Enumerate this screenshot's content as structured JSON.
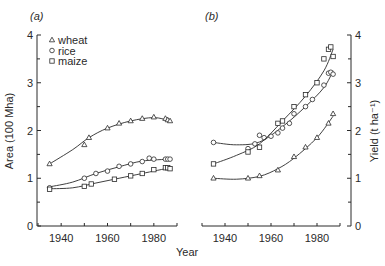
{
  "figure": {
    "panel_a_label": "(a)",
    "panel_b_label": "(b)",
    "shared_xlabel": "Year",
    "colors": {
      "ink": "#2a2a2a",
      "background": "#ffffff"
    }
  },
  "legend": {
    "position": "top-left of panel (a)",
    "entries": [
      {
        "name": "wheat",
        "marker": "triangle"
      },
      {
        "name": "rice",
        "marker": "circle"
      },
      {
        "name": "maize",
        "marker": "square"
      }
    ]
  },
  "chart_data": [
    {
      "type": "scatter",
      "title": "(a)",
      "xlabel": "Year",
      "ylabel": "Area (100 Mha)",
      "xlim": [
        1930,
        1990
      ],
      "ylim": [
        0,
        4
      ],
      "xticks": [
        1940,
        1960,
        1980
      ],
      "xminor": [
        1930,
        1950,
        1970,
        1990
      ],
      "yticks": [
        0,
        1,
        2,
        3,
        4
      ],
      "ytick_labels": [
        "0",
        "1",
        "2",
        "3",
        "4"
      ],
      "xtick_labels": [
        "1940",
        "1960",
        "1980"
      ],
      "grid": false,
      "yaxis_side": "left",
      "legend": [
        "wheat",
        "rice",
        "maize"
      ],
      "series": [
        {
          "name": "wheat",
          "marker": "triangle",
          "x": [
            1935,
            1950,
            1952,
            1960,
            1965,
            1970,
            1975,
            1980,
            1985,
            1986,
            1987
          ],
          "y": [
            1.3,
            1.7,
            1.85,
            2.05,
            2.15,
            2.2,
            2.25,
            2.28,
            2.25,
            2.22,
            2.2
          ],
          "fit": [
            [
              1935,
              1.3
            ],
            [
              1945,
              1.6
            ],
            [
              1952,
              1.85
            ],
            [
              1960,
              2.05
            ],
            [
              1970,
              2.2
            ],
            [
              1980,
              2.27
            ],
            [
              1987,
              2.2
            ]
          ]
        },
        {
          "name": "rice",
          "marker": "circle",
          "x": [
            1935,
            1950,
            1955,
            1960,
            1965,
            1970,
            1975,
            1978,
            1980,
            1985,
            1986,
            1987
          ],
          "y": [
            0.8,
            1.0,
            1.1,
            1.15,
            1.25,
            1.3,
            1.35,
            1.42,
            1.4,
            1.4,
            1.4,
            1.4
          ],
          "fit": [
            [
              1935,
              0.82
            ],
            [
              1945,
              0.92
            ],
            [
              1955,
              1.1
            ],
            [
              1965,
              1.24
            ],
            [
              1975,
              1.36
            ],
            [
              1987,
              1.4
            ]
          ]
        },
        {
          "name": "maize",
          "marker": "square",
          "x": [
            1935,
            1950,
            1953,
            1963,
            1970,
            1975,
            1980,
            1985,
            1986,
            1987
          ],
          "y": [
            0.77,
            0.83,
            0.88,
            0.98,
            1.05,
            1.1,
            1.18,
            1.22,
            1.22,
            1.2
          ],
          "fit": [
            [
              1935,
              0.78
            ],
            [
              1945,
              0.8
            ],
            [
              1955,
              0.9
            ],
            [
              1965,
              1.0
            ],
            [
              1975,
              1.1
            ],
            [
              1987,
              1.22
            ]
          ]
        }
      ]
    },
    {
      "type": "scatter",
      "title": "(b)",
      "xlabel": "Year",
      "ylabel": "Yield (t ha⁻¹)",
      "xlim": [
        1930,
        1990
      ],
      "ylim": [
        0,
        4
      ],
      "xticks": [
        1940,
        1960,
        1980
      ],
      "xminor": [
        1930,
        1950,
        1970,
        1990
      ],
      "yticks": [
        0,
        1,
        2,
        3,
        4
      ],
      "ytick_labels": [
        "0",
        "1",
        "2",
        "3",
        "4"
      ],
      "xtick_labels": [
        "1940",
        "1960",
        "1980"
      ],
      "grid": false,
      "yaxis_side": "right",
      "series": [
        {
          "name": "wheat",
          "marker": "triangle",
          "x": [
            1935,
            1950,
            1955,
            1963,
            1970,
            1975,
            1980,
            1985,
            1987
          ],
          "y": [
            1.0,
            1.0,
            1.05,
            1.17,
            1.45,
            1.65,
            1.85,
            2.15,
            2.35
          ],
          "fit": [
            [
              1935,
              1.0
            ],
            [
              1945,
              0.98
            ],
            [
              1955,
              1.04
            ],
            [
              1963,
              1.2
            ],
            [
              1970,
              1.42
            ],
            [
              1980,
              1.85
            ],
            [
              1987,
              2.3
            ]
          ]
        },
        {
          "name": "rice",
          "marker": "circle",
          "x": [
            1935,
            1950,
            1953,
            1955,
            1957,
            1960,
            1963,
            1965,
            1968,
            1970,
            1975,
            1978,
            1983,
            1985,
            1986,
            1987
          ],
          "y": [
            1.75,
            1.62,
            1.72,
            1.9,
            1.85,
            1.88,
            1.95,
            2.05,
            2.15,
            2.35,
            2.5,
            2.65,
            2.95,
            3.2,
            3.22,
            3.18
          ],
          "fit": [
            [
              1935,
              1.75
            ],
            [
              1945,
              1.7
            ],
            [
              1955,
              1.76
            ],
            [
              1965,
              2.08
            ],
            [
              1975,
              2.5
            ],
            [
              1983,
              2.9
            ],
            [
              1987,
              3.25
            ]
          ]
        },
        {
          "name": "maize",
          "marker": "square",
          "x": [
            1935,
            1950,
            1955,
            1963,
            1965,
            1970,
            1975,
            1980,
            1983,
            1985,
            1986,
            1987
          ],
          "y": [
            1.3,
            1.55,
            1.65,
            2.15,
            2.2,
            2.5,
            2.75,
            3.0,
            3.5,
            3.7,
            3.75,
            3.55
          ],
          "fit": [
            [
              1935,
              1.3
            ],
            [
              1945,
              1.48
            ],
            [
              1955,
              1.72
            ],
            [
              1965,
              2.2
            ],
            [
              1975,
              2.72
            ],
            [
              1983,
              3.25
            ],
            [
              1987,
              3.7
            ]
          ]
        }
      ]
    }
  ]
}
